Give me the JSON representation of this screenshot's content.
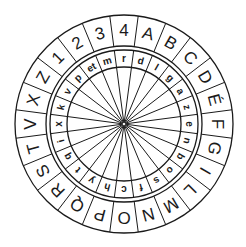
{
  "diagram": {
    "center": [
      124,
      124
    ],
    "colors": {
      "ink": "#1a1a1a",
      "background": "#ffffff"
    },
    "radii": {
      "outer": 109,
      "outer_ring_inner": 78,
      "inner_ring_outer": 74,
      "inner_ring_inner": 57
    },
    "segment_count": 24,
    "outer_ring": {
      "label": "stabilis (outer fixed ring)",
      "characters": [
        "4",
        "A",
        "B",
        "C",
        "D",
        "É",
        "F",
        "G",
        "I",
        "L",
        "M",
        "N",
        "O",
        "P",
        "Q",
        "R",
        "S",
        "T",
        "V",
        "X",
        "Z",
        "1",
        "2",
        "3"
      ]
    },
    "inner_ring": {
      "label": "mobilis (inner rotating ring)",
      "characters": [
        "r",
        "d",
        "l",
        "g",
        "a",
        "z",
        "e",
        "n",
        "b",
        "o",
        "s",
        "f",
        "c",
        "h",
        "y",
        "t",
        "q",
        "i",
        "x",
        "k",
        "v",
        "p",
        "et",
        "m"
      ]
    }
  }
}
